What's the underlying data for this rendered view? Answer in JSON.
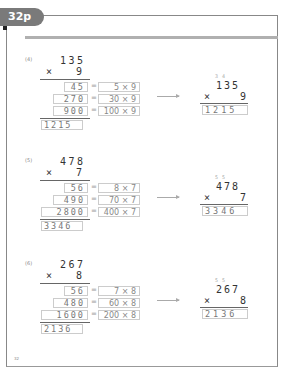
{
  "header": {
    "page_tab": "32p"
  },
  "problems": [
    {
      "label": "(4)",
      "multiplicand": "135",
      "multiplier": "9",
      "times_sign": "×",
      "partials": [
        {
          "value": "45",
          "expr": "5 × 9"
        },
        {
          "value": "270",
          "expr": "30 × 9"
        },
        {
          "value": "900",
          "expr": "100 × 9"
        }
      ],
      "result": "1215",
      "carries": "34",
      "shortcut": {
        "multiplicand": "135",
        "multiplier": "9",
        "result": "1215"
      }
    },
    {
      "label": "(5)",
      "multiplicand": "478",
      "multiplier": "7",
      "times_sign": "×",
      "partials": [
        {
          "value": "56",
          "expr": "8 × 7"
        },
        {
          "value": "490",
          "expr": "70 × 7"
        },
        {
          "value": "2800",
          "expr": "400 × 7"
        }
      ],
      "result": "3346",
      "carries": "55",
      "shortcut": {
        "multiplicand": "478",
        "multiplier": "7",
        "result": "3346"
      }
    },
    {
      "label": "(6)",
      "multiplicand": "267",
      "multiplier": "8",
      "times_sign": "×",
      "partials": [
        {
          "value": "56",
          "expr": "7 × 8"
        },
        {
          "value": "480",
          "expr": "60 × 8"
        },
        {
          "value": "1600",
          "expr": "200 × 8"
        }
      ],
      "result": "2136",
      "carries": "55",
      "shortcut": {
        "multiplicand": "267",
        "multiplier": "8",
        "result": "2136"
      }
    }
  ],
  "equals_sign": "=",
  "footer": {
    "page_number": "32"
  }
}
